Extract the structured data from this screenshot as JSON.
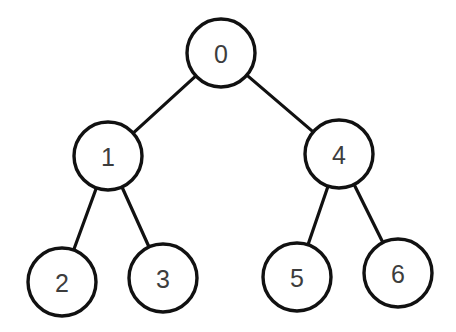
{
  "diagram": {
    "type": "binary-tree",
    "stroke_color": "#111111",
    "label_color": "#3d3d3d",
    "background": "#ffffff",
    "node_radius": 34,
    "nodes": [
      {
        "id": "0",
        "label": "0",
        "cx": 221,
        "cy": 53
      },
      {
        "id": "1",
        "label": "1",
        "cx": 108,
        "cy": 156
      },
      {
        "id": "4",
        "label": "4",
        "cx": 339,
        "cy": 154
      },
      {
        "id": "2",
        "label": "2",
        "cx": 62,
        "cy": 282
      },
      {
        "id": "3",
        "label": "3",
        "cx": 163,
        "cy": 278
      },
      {
        "id": "5",
        "label": "5",
        "cx": 297,
        "cy": 277
      },
      {
        "id": "6",
        "label": "6",
        "cx": 398,
        "cy": 273
      }
    ],
    "edges": [
      {
        "from": "0",
        "to": "1"
      },
      {
        "from": "0",
        "to": "4"
      },
      {
        "from": "1",
        "to": "2"
      },
      {
        "from": "1",
        "to": "3"
      },
      {
        "from": "4",
        "to": "5"
      },
      {
        "from": "4",
        "to": "6"
      }
    ]
  }
}
